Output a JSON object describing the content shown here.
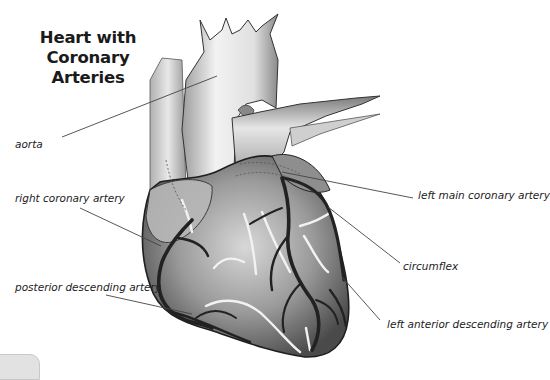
{
  "title": {
    "line1": "Heart with",
    "line2": "Coronary Arteries"
  },
  "labels": [
    {
      "id": "aorta",
      "text": "aorta"
    },
    {
      "id": "right-coronary-artery",
      "text": "right coronary artery"
    },
    {
      "id": "posterior-descending-artery",
      "text": "posterior descending artery"
    },
    {
      "id": "left-main-coronary-artery",
      "text": "left main coronary artery"
    },
    {
      "id": "circumflex",
      "text": "circumflex"
    },
    {
      "id": "left-anterior-descending-artery",
      "text": "left anterior descending artery"
    }
  ],
  "colors": {
    "background": "#ffffff",
    "text": "#222222",
    "leader_line": "#444444",
    "heart_shading": "#8a8a8a",
    "artery_dark": "#2a2a2a",
    "fat_highlight": "#f4f4f4"
  }
}
